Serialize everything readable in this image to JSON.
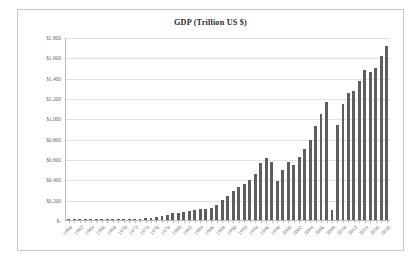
{
  "chart_data": {
    "type": "bar",
    "title": "GDP (Trillion US $)",
    "xlabel": "",
    "ylabel": "",
    "ylim": [
      0,
      1.8
    ],
    "ytick_labels": [
      "$1.800",
      "$1.600",
      "$1.400",
      "$1.200",
      "$1.000",
      "$0.800",
      "$0.600",
      "$0.400",
      "$0.200",
      "$-"
    ],
    "ytick_values": [
      1.8,
      1.6,
      1.4,
      1.2,
      1.0,
      0.8,
      0.6,
      0.4,
      0.2,
      0.0
    ],
    "grid": true,
    "legend": false,
    "bar_color": "#5e5e5e",
    "xtick_every": 2,
    "categories": [
      "1960",
      "1961",
      "1962",
      "1963",
      "1964",
      "1965",
      "1966",
      "1967",
      "1968",
      "1969",
      "1970",
      "1971",
      "1972",
      "1973",
      "1974",
      "1975",
      "1976",
      "1977",
      "1978",
      "1979",
      "1980",
      "1981",
      "1982",
      "1983",
      "1984",
      "1985",
      "1986",
      "1987",
      "1988",
      "1989",
      "1990",
      "1991",
      "1992",
      "1993",
      "1994",
      "1995",
      "1996",
      "1997",
      "1998",
      "1999",
      "2000",
      "2001",
      "2002",
      "2003",
      "2004",
      "2005",
      "2006",
      "2007",
      "2008",
      "2009",
      "2010",
      "2011",
      "2012",
      "2013",
      "2014",
      "2015",
      "2016",
      "2017",
      "2018"
    ],
    "xtick_labels": [
      "1960",
      "1962",
      "1964",
      "1966",
      "1968",
      "1970",
      "1972",
      "1974",
      "1976",
      "1978",
      "1980",
      "1982",
      "1984",
      "1986",
      "1988",
      "1990",
      "1992",
      "1994",
      "1996",
      "1998",
      "2000",
      "2002",
      "2004",
      "2006",
      "2008",
      "2010",
      "2012",
      "2014",
      "2016",
      "2018"
    ],
    "values": [
      0.004,
      0.003,
      0.003,
      0.004,
      0.004,
      0.004,
      0.005,
      0.006,
      0.007,
      0.008,
      0.009,
      0.01,
      0.011,
      0.014,
      0.02,
      0.022,
      0.03,
      0.038,
      0.052,
      0.068,
      0.066,
      0.076,
      0.085,
      0.097,
      0.108,
      0.105,
      0.12,
      0.15,
      0.2,
      0.24,
      0.283,
      0.33,
      0.356,
      0.392,
      0.453,
      0.566,
      0.61,
      0.569,
      0.383,
      0.497,
      0.576,
      0.547,
      0.627,
      0.702,
      0.794,
      0.934,
      1.053,
      1.172,
      0.102,
      0.944,
      1.144,
      1.253,
      1.278,
      1.371,
      1.484,
      1.466,
      1.5,
      1.623,
      1.725
    ],
    "series_name": "GDP"
  },
  "card": {
    "title": "GDP (Trillion US $)"
  }
}
